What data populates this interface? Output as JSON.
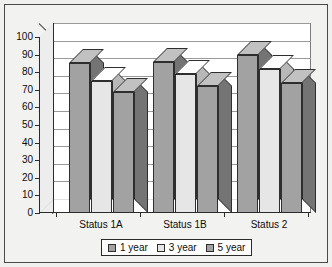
{
  "chart_data": {
    "type": "bar",
    "title": "",
    "subtitle": "",
    "xlabel": "",
    "ylabel": "",
    "categories": [
      "Status 1A",
      "Status 1B",
      "Status 2"
    ],
    "series": [
      {
        "name": "1 year",
        "color": "#a2a2a2",
        "values": [
          85,
          86,
          90
        ]
      },
      {
        "name": "3 year",
        "color": "#e6e6e6",
        "values": [
          75,
          79,
          82
        ]
      },
      {
        "name": "5 year",
        "color": "#a2a2a2",
        "values": [
          69,
          72,
          74
        ]
      }
    ],
    "ylim": [
      0,
      100
    ],
    "ytick_step": 10,
    "yticks": [
      100,
      90,
      80,
      70,
      60,
      50,
      40,
      30,
      20,
      10,
      0
    ],
    "ytick_labels": [
      "100",
      "90",
      "80",
      "70",
      "60",
      "50",
      "40",
      "30",
      "20",
      "10",
      "0"
    ],
    "grid": true,
    "grid_axis": "y",
    "legend_position": "bottom",
    "style": "3d-clustered-column",
    "plot_background": "#ffffff",
    "figure_background": "#f2f2f0",
    "border_color": "#4a4a4a",
    "bar_outline_color": "#2e2e2e",
    "gridline_color": "#9a9a9a",
    "axis_color": "#2b2b2b",
    "text_color": "#0c0c0c"
  },
  "legend": {
    "items": [
      {
        "label": "1 year"
      },
      {
        "label": "3 year"
      },
      {
        "label": "5 year"
      }
    ]
  }
}
